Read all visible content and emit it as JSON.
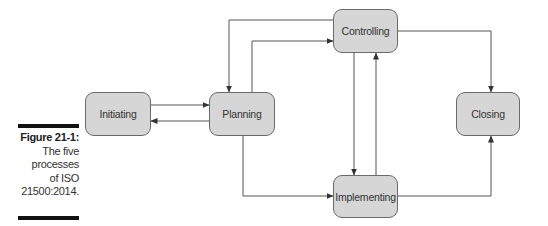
{
  "caption": {
    "label": "Figure 21-1:",
    "lines": [
      "The five",
      "processes",
      "of ISO",
      "21500:2014."
    ]
  },
  "nodes": {
    "initiating": "Initiating",
    "planning": "Planning",
    "controlling": "Controlling",
    "implementing": "Implementing",
    "closing": "Closing"
  },
  "edges": [
    {
      "from": "Initiating",
      "to": "Planning"
    },
    {
      "from": "Planning",
      "to": "Initiating"
    },
    {
      "from": "Controlling",
      "to": "Planning"
    },
    {
      "from": "Planning",
      "to": "Controlling"
    },
    {
      "from": "Planning",
      "to": "Implementing"
    },
    {
      "from": "Controlling",
      "to": "Implementing"
    },
    {
      "from": "Implementing",
      "to": "Controlling"
    },
    {
      "from": "Controlling",
      "to": "Closing"
    },
    {
      "from": "Implementing",
      "to": "Closing"
    }
  ],
  "colors": {
    "node_fill": "#d6d6d6",
    "node_border": "#6a6a6a",
    "edge": "#555555",
    "caption_bar": "#111111"
  }
}
